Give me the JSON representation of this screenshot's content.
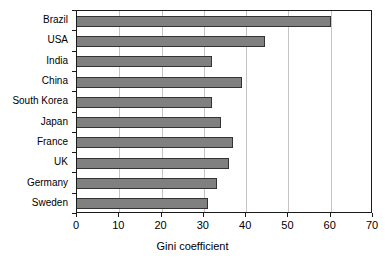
{
  "chart_data": {
    "type": "bar",
    "orientation": "horizontal",
    "title": "",
    "xlabel": "Gini coefficient",
    "ylabel": "",
    "categories": [
      "Brazil",
      "USA",
      "India",
      "China",
      "South Korea",
      "Japan",
      "France",
      "UK",
      "Germany",
      "Sweden"
    ],
    "values": [
      60,
      44.5,
      32,
      39,
      32,
      34,
      37,
      36,
      33,
      31
    ],
    "xlim": [
      0,
      70
    ],
    "xticks": [
      0,
      10,
      20,
      30,
      40,
      50,
      60,
      70
    ],
    "xtick_labels": [
      "0",
      "10",
      "20",
      "30",
      "40",
      "50",
      "60",
      "70"
    ],
    "grid": "vertical",
    "legend": "none",
    "bar_color": "#808080",
    "bar_edge_color": "#333333",
    "gridline_color": "#c4c4c4",
    "frame_color": "#1a1a1a"
  }
}
